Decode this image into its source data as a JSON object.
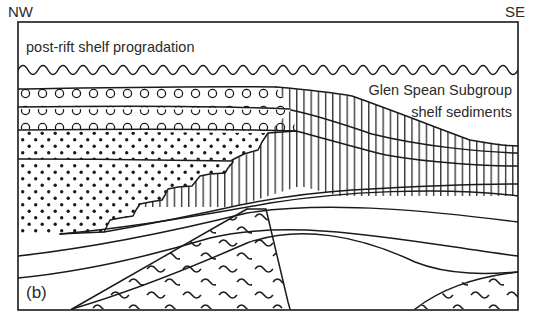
{
  "figure": {
    "panel_label": "(b)",
    "orientation_left": "NW",
    "orientation_right": "SE",
    "frame": {
      "x": 18,
      "y": 22,
      "width": 500,
      "height": 288
    },
    "background": "#ffffff",
    "line_color": "#1a1a1a",
    "text_color": "#2b2b2b"
  },
  "annotations": [
    {
      "id": "post-rift",
      "text": "post-rift shelf progradation",
      "x": 26,
      "y": 52,
      "anchor": "start"
    },
    {
      "id": "glen-spean-1",
      "text": "Glen Spean Subgroup",
      "x": 512,
      "y": 95,
      "anchor": "end"
    },
    {
      "id": "glen-spean-2",
      "text": "shelf sediments",
      "x": 512,
      "y": 117,
      "anchor": "end"
    }
  ],
  "units": [
    {
      "id": "post-rift-shelf",
      "pattern": "blank",
      "label": "post-rift shelf progradation"
    },
    {
      "id": "conglomerate-upper",
      "pattern": "circles",
      "label": "conglomerate"
    },
    {
      "id": "conglomerate-lower",
      "pattern": "circles",
      "label": "conglomerate"
    },
    {
      "id": "sandstone-upper",
      "pattern": "dots",
      "label": "sandstone"
    },
    {
      "id": "sandstone-lower",
      "pattern": "dots",
      "label": "sandstone"
    },
    {
      "id": "shelf-sediments",
      "pattern": "vertical-hatch",
      "label": "Glen Spean Subgroup shelf sediments"
    },
    {
      "id": "basement-main",
      "pattern": "tildes",
      "label": "basement"
    },
    {
      "id": "basement-se",
      "pattern": "tildes",
      "label": "basement"
    }
  ],
  "boundaries": [
    {
      "id": "wavy-unconformity",
      "style": "wavy",
      "y": 70
    },
    {
      "id": "staircase-interfinger",
      "style": "stepped"
    },
    {
      "id": "diagonal-fault",
      "style": "straight"
    }
  ]
}
